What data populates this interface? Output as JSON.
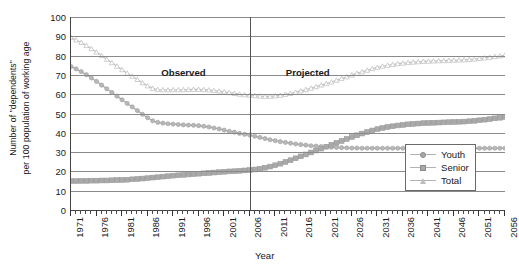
{
  "axes": {
    "y_title_line1": "Number of \"dependents\"",
    "y_title_line2": "per 100 population of working age",
    "x_title": "Year"
  },
  "annotations": {
    "observed": "Observed",
    "projected": "Projected",
    "divider_year": 2006
  },
  "legend": {
    "items": [
      {
        "label": "Youth",
        "marker": "diamond-dot-icon",
        "color": "#a8a8a8"
      },
      {
        "label": "Senior",
        "marker": "filled-square-icon",
        "color": "#a8a8a8"
      },
      {
        "label": "Total",
        "marker": "open-triangle-icon",
        "color": "#bdbdbd"
      }
    ]
  },
  "chart_data": {
    "type": "line",
    "title": "",
    "xlabel": "Year",
    "ylabel": "Number of \"dependents\" per 100 population of working age",
    "xlim": [
      1971,
      2056
    ],
    "ylim": [
      0,
      100
    ],
    "ytick_step": 10,
    "yticks": [
      0,
      10,
      20,
      30,
      40,
      50,
      60,
      70,
      80,
      90,
      100
    ],
    "xticks_major": [
      1971,
      1976,
      1981,
      1986,
      1991,
      1996,
      2001,
      2006,
      2011,
      2016,
      2021,
      2026,
      2031,
      2036,
      2041,
      2046,
      2051,
      2056
    ],
    "xtick_minor_step": 1,
    "grid": "horizontal",
    "legend_position": "bottom-right",
    "annotations": [
      {
        "text": "Observed",
        "x": 1993,
        "y": 71
      },
      {
        "text": "Projected",
        "x": 2017,
        "y": 71
      },
      {
        "type": "vline",
        "x": 2006
      }
    ],
    "x": [
      1971,
      1972,
      1973,
      1974,
      1975,
      1976,
      1977,
      1978,
      1979,
      1980,
      1981,
      1982,
      1983,
      1984,
      1985,
      1986,
      1987,
      1988,
      1989,
      1990,
      1991,
      1992,
      1993,
      1994,
      1995,
      1996,
      1997,
      1998,
      1999,
      2000,
      2001,
      2002,
      2003,
      2004,
      2005,
      2006,
      2007,
      2008,
      2009,
      2010,
      2011,
      2012,
      2013,
      2014,
      2015,
      2016,
      2017,
      2018,
      2019,
      2020,
      2021,
      2022,
      2023,
      2024,
      2025,
      2026,
      2027,
      2028,
      2029,
      2030,
      2031,
      2032,
      2033,
      2034,
      2035,
      2036,
      2037,
      2038,
      2039,
      2040,
      2041,
      2042,
      2043,
      2044,
      2045,
      2046,
      2047,
      2048,
      2049,
      2050,
      2051,
      2052,
      2053,
      2054,
      2055,
      2056
    ],
    "series": [
      {
        "name": "Youth",
        "values": [
          74.3,
          73.1,
          71.7,
          70.1,
          68.4,
          66.6,
          64.7,
          62.8,
          60.9,
          59.0,
          57.1,
          55.2,
          53.4,
          51.5,
          49.6,
          47.8,
          46.2,
          45.4,
          45.0,
          44.7,
          44.5,
          44.3,
          44.1,
          44.0,
          43.9,
          43.7,
          43.4,
          43.0,
          42.5,
          42.0,
          41.4,
          40.8,
          40.3,
          39.7,
          39.2,
          38.8,
          38.2,
          37.6,
          37.0,
          36.4,
          35.9,
          35.4,
          35.0,
          34.6,
          34.2,
          33.9,
          33.6,
          33.3,
          33.1,
          32.9,
          32.7,
          32.5,
          32.4,
          32.3,
          32.2,
          32.1,
          32.1,
          32.0,
          32.0,
          32.0,
          32.0,
          32.0,
          32.0,
          32.0,
          32.0,
          32.0,
          32.0,
          32.0,
          32.0,
          32.0,
          32.0,
          32.0,
          32.0,
          32.0,
          32.0,
          32.0,
          32.0,
          32.0,
          32.0,
          32.0,
          32.0,
          32.0,
          32.0,
          32.0,
          32.0,
          32.0
        ]
      },
      {
        "name": "Senior",
        "values": [
          15.0,
          15.0,
          15.1,
          15.1,
          15.2,
          15.2,
          15.3,
          15.3,
          15.4,
          15.5,
          15.6,
          15.7,
          15.9,
          16.1,
          16.3,
          16.5,
          16.8,
          17.0,
          17.3,
          17.5,
          17.8,
          18.0,
          18.2,
          18.4,
          18.6,
          18.8,
          19.0,
          19.2,
          19.4,
          19.6,
          19.8,
          20.0,
          20.1,
          20.3,
          20.5,
          20.7,
          21.0,
          21.4,
          21.9,
          22.5,
          23.2,
          24.0,
          24.9,
          25.8,
          26.8,
          27.8,
          28.8,
          29.8,
          30.8,
          31.8,
          32.8,
          33.8,
          34.8,
          35.8,
          36.8,
          37.8,
          38.7,
          39.6,
          40.4,
          41.2,
          41.9,
          42.5,
          43.0,
          43.4,
          43.8,
          44.1,
          44.4,
          44.6,
          44.8,
          45.0,
          45.1,
          45.2,
          45.3,
          45.4,
          45.5,
          45.6,
          45.7,
          45.8,
          46.0,
          46.2,
          46.5,
          46.8,
          47.1,
          47.5,
          47.8,
          48.2
        ]
      },
      {
        "name": "Total",
        "values": [
          89.3,
          88.1,
          86.8,
          85.2,
          83.6,
          81.8,
          80.0,
          78.1,
          76.3,
          74.5,
          72.7,
          70.9,
          69.3,
          67.6,
          65.9,
          64.3,
          63.0,
          62.4,
          62.3,
          62.2,
          62.3,
          62.3,
          62.3,
          62.4,
          62.5,
          62.5,
          62.4,
          62.2,
          61.9,
          61.6,
          61.2,
          60.8,
          60.4,
          60.0,
          59.7,
          59.5,
          59.2,
          59.0,
          58.9,
          58.9,
          59.1,
          59.4,
          59.9,
          60.4,
          61.0,
          61.7,
          62.4,
          63.1,
          63.9,
          64.7,
          65.5,
          66.3,
          67.2,
          68.1,
          69.0,
          69.9,
          70.8,
          71.6,
          72.4,
          73.2,
          73.9,
          74.5,
          75.0,
          75.4,
          75.8,
          76.1,
          76.4,
          76.6,
          76.8,
          77.0,
          77.1,
          77.2,
          77.3,
          77.4,
          77.5,
          77.6,
          77.7,
          77.8,
          78.0,
          78.2,
          78.5,
          78.8,
          79.1,
          79.5,
          79.8,
          80.2
        ]
      }
    ]
  }
}
